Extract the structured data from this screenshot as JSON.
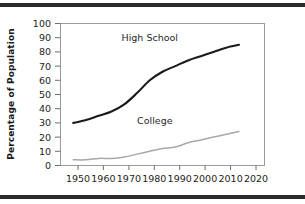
{
  "chart_data": {
    "type": "line",
    "title": "",
    "subtitle": "",
    "xlabel": "",
    "ylabel": "Percentage of Population",
    "xlim": [
      1945,
      2025
    ],
    "ylim": [
      0,
      100
    ],
    "grid": false,
    "legend_position": "inline-annotation",
    "x_ticks": [
      "1950",
      "1960",
      "1970",
      "1980",
      "1990",
      "2000",
      "2010",
      "2020"
    ],
    "y_ticks": [
      "0",
      "10",
      "20",
      "30",
      "40",
      "50",
      "60",
      "70",
      "80",
      "90",
      "100"
    ],
    "x": [
      1950,
      1955,
      1960,
      1965,
      1970,
      1975,
      1980,
      1985,
      1990,
      1995,
      2000,
      2005,
      2010,
      2015
    ],
    "series": [
      {
        "name": "High School",
        "color": "#1a1a1a",
        "values": [
          30,
          32,
          35,
          38,
          43,
          51,
          60,
          66,
          70,
          74,
          77,
          80,
          83,
          85
        ]
      },
      {
        "name": "College",
        "color": "#a8a8ab",
        "values": [
          4,
          4,
          5,
          5,
          6,
          8,
          10,
          12,
          13,
          16,
          18,
          20,
          22,
          24
        ]
      }
    ],
    "annotations": [
      {
        "text": "High School",
        "x": 1980,
        "y": 88
      },
      {
        "text": "College",
        "x": 1982,
        "y": 29
      }
    ]
  },
  "decor": {
    "top_rule": "",
    "bottom_rule": ""
  }
}
